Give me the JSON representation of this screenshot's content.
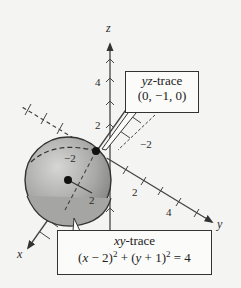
{
  "figure": {
    "axes": {
      "x_label": "x",
      "y_label": "y",
      "z_label": "z",
      "z_ticks": [
        "2",
        "4"
      ],
      "y_ticks": [
        "2",
        "4"
      ],
      "y_neg_tick": "-2",
      "x_ticks": [
        "2"
      ],
      "x_neg_tick": "-2"
    },
    "sphere": {
      "center_label": "center",
      "radius_label": "2",
      "fill_color": "#a9a9a9"
    },
    "yz_trace": {
      "title": "yz-trace",
      "point": "(0, −1, 0)"
    },
    "xy_trace": {
      "title": "xy-trace",
      "equation_left": "(x − 2)",
      "equation_mid": "+ (y + 1)",
      "equation_right": "= 4",
      "exponent": "2"
    }
  }
}
